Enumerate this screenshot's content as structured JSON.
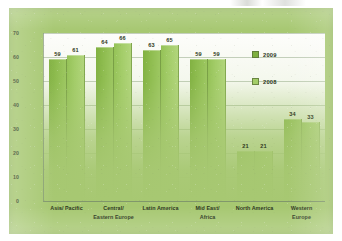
{
  "chart_data": {
    "type": "bar",
    "title": "",
    "xlabel": "",
    "ylabel": "",
    "ylim": [
      0,
      70
    ],
    "yticks": [
      0,
      10,
      20,
      30,
      40,
      50,
      60,
      70
    ],
    "grid": true,
    "legend_position": "inside-right",
    "categories": [
      "Asia/ Pacific",
      "Central/\nEastern Europe",
      "Latin America",
      "Mid East/\nAfrica",
      "North America",
      "Western\nEurope"
    ],
    "series": [
      {
        "name": "2009",
        "color": "#7fb03f",
        "values": [
          59,
          64,
          63,
          59,
          21,
          34
        ]
      },
      {
        "name": "2008",
        "color": "#a3cd68",
        "values": [
          61,
          66,
          65,
          59,
          21,
          33
        ]
      }
    ]
  },
  "colors": {
    "card_background": "#a7c872",
    "plot_background": "#fdfdfb",
    "series_2009": "#7fb03f",
    "series_2008": "#a3cd68",
    "gridline": "#96aa8c",
    "text": "#2c3720"
  }
}
